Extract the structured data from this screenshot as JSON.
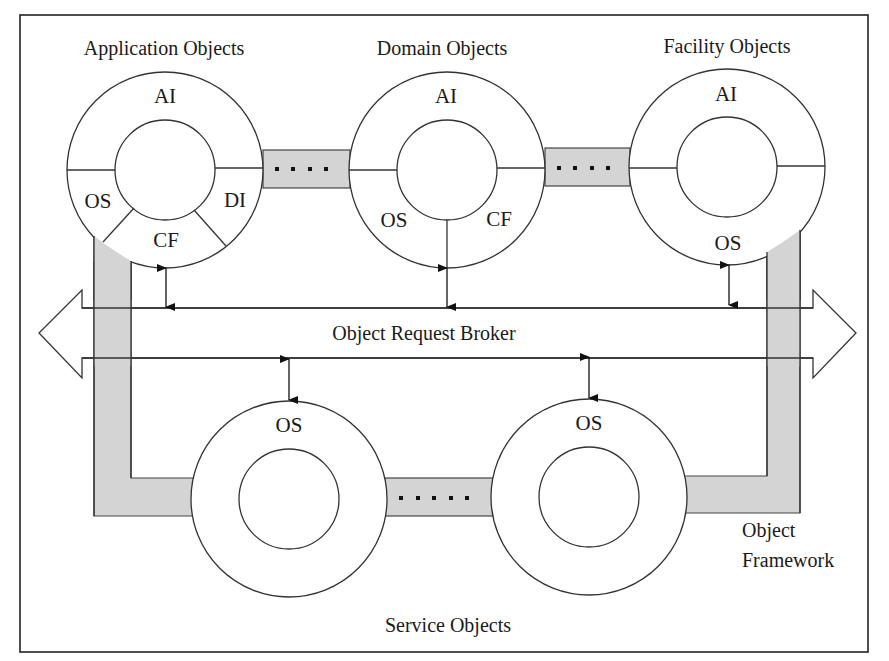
{
  "diagram": {
    "type": "architecture",
    "colors": {
      "line": "#333333",
      "framework_band": "#d4d4d4",
      "background": "#ffffff"
    },
    "groups": {
      "application": {
        "title": "Application Objects",
        "segments": [
          "AI",
          "OS",
          "DI",
          "CF"
        ]
      },
      "domain": {
        "title": "Domain Objects",
        "segments": [
          "AI",
          "OS",
          "CF"
        ]
      },
      "facility": {
        "title": "Facility Objects",
        "segments": [
          "AI",
          "OS"
        ]
      },
      "service": {
        "title": "Service Objects",
        "left_segment": "OS",
        "right_segment": "OS"
      }
    },
    "bus": {
      "label": "Object Request Broker"
    },
    "framework": {
      "label_line1": "Object",
      "label_line2": "Framework"
    },
    "ellipsis": "...."
  }
}
